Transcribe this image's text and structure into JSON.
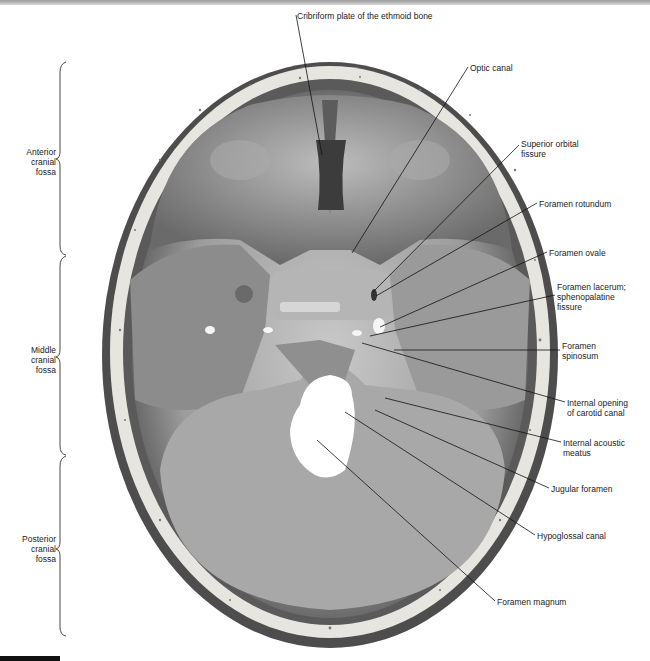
{
  "figure": {
    "colors": {
      "bone_light": "#e8e6e0",
      "bone_mid": "#a9a9a9",
      "bone_dark": "#4a4a4a",
      "leader_line": "#111111",
      "bracket": "#333333"
    }
  },
  "regions": [
    {
      "label": "Anterior\ncranial\nfossa",
      "bracket_top": 62,
      "bracket_bottom": 255
    },
    {
      "label": "Middle\ncranial\nfossa",
      "bracket_top": 255,
      "bracket_bottom": 455
    },
    {
      "label": "Posterior\ncranial\nfossa",
      "bracket_top": 455,
      "bracket_bottom": 635
    }
  ],
  "labels": [
    {
      "text": "Cribriform plate of the ethmoid bone",
      "x": 297,
      "y": 11
    },
    {
      "text": "Optic canal",
      "x": 470,
      "y": 63
    },
    {
      "text": "Superior orbital\nfissure",
      "x": 521,
      "y": 139
    },
    {
      "text": "Foramen rotundum",
      "x": 539,
      "y": 199
    },
    {
      "text": "Foramen ovale",
      "x": 549,
      "y": 248
    },
    {
      "text": "Foramen lacerum;\nsphenopalatine\nfissure",
      "x": 557,
      "y": 282
    },
    {
      "text": "Foramen\nspinosum",
      "x": 562,
      "y": 341
    },
    {
      "text": "Internal opening\nof carotid canal",
      "x": 567,
      "y": 398
    },
    {
      "text": "Internal acoustic\nmeatus",
      "x": 563,
      "y": 438
    },
    {
      "text": "Jugular foramen",
      "x": 551,
      "y": 484
    },
    {
      "text": "Hypoglossal canal",
      "x": 537,
      "y": 531
    },
    {
      "text": "Foramen magnum",
      "x": 497,
      "y": 597
    }
  ]
}
